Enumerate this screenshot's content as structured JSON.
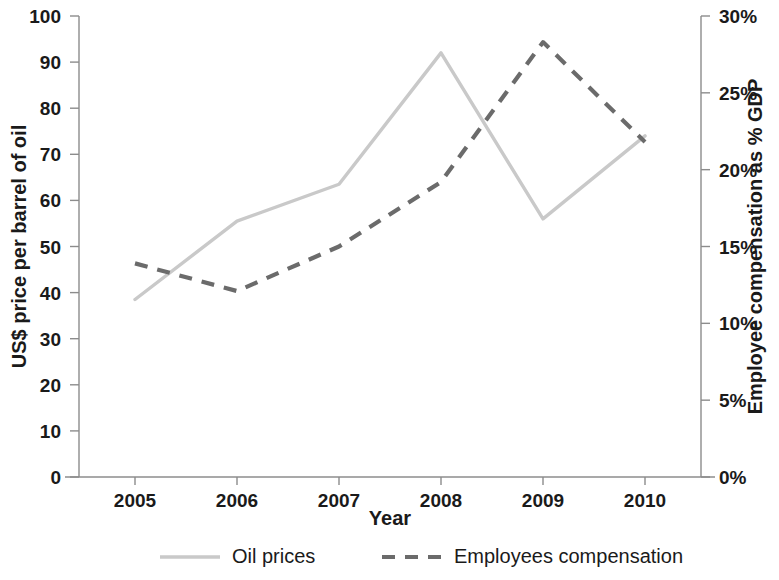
{
  "chart_data": {
    "type": "line",
    "title": "",
    "xlabel": "Year",
    "ylabel": "US$ price per barrel of oil",
    "y2label": "Employee compensation as % GDP",
    "categories": [
      "2005",
      "2006",
      "2007",
      "2008",
      "2009",
      "2010"
    ],
    "x": [
      2005,
      2006,
      2007,
      2008,
      2009,
      2010
    ],
    "ylim": [
      0,
      100
    ],
    "y2lim": [
      0,
      30
    ],
    "yticks": [
      0,
      10,
      20,
      30,
      40,
      50,
      60,
      70,
      80,
      90,
      100
    ],
    "ytick_labels": [
      "0",
      "10",
      "20",
      "30",
      "40",
      "50",
      "60",
      "70",
      "80",
      "90",
      "100"
    ],
    "y2ticks": [
      0,
      5,
      10,
      15,
      20,
      25,
      30
    ],
    "y2tick_labels": [
      "0%",
      "5%",
      "10%",
      "15%",
      "20%",
      "25%",
      "30%"
    ],
    "grid": false,
    "legend_position": "bottom",
    "series": [
      {
        "name": "Oil prices",
        "axis": "left",
        "style": "solid",
        "color": "#c9c9c9",
        "values": [
          38.5,
          55.5,
          63.5,
          92.0,
          56.0,
          74.0
        ]
      },
      {
        "name": "Employees compensation",
        "axis": "right",
        "style": "dashed",
        "color": "#6b6b6b",
        "values": [
          13.9,
          12.1,
          15.0,
          19.2,
          28.3,
          21.8
        ]
      }
    ]
  },
  "axes": {
    "left_title": "US$ price per barrel of oil",
    "right_title": "Employee compensation as % GDP",
    "x_title": "Year"
  },
  "legend": {
    "items": [
      {
        "label": "Oil prices",
        "style": "solid",
        "color": "#c9c9c9"
      },
      {
        "label": "Employees compensation",
        "style": "dashed",
        "color": "#6b6b6b"
      }
    ]
  },
  "colors": {
    "oil_line": "#c9c9c9",
    "compensation_line": "#6b6b6b",
    "axis": "#8c8c8c",
    "text": "#1a1a1a",
    "background": "#ffffff"
  }
}
